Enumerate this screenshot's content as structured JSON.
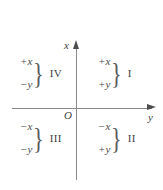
{
  "figure": {
    "background_color": "#ffffff",
    "axis_color": "#8a8a8a",
    "text_color": "#4a4a4a"
  },
  "axes": {
    "vertical_label": "x",
    "horizontal_label": "y",
    "origin_label": "O"
  },
  "brace_glyph": "}",
  "quadrants": [
    {
      "position": "upper-left",
      "numeral": "IV",
      "sign_x": "+x",
      "sign_y": "−y"
    },
    {
      "position": "upper-right",
      "numeral": "I",
      "sign_x": "+x",
      "sign_y": "+y"
    },
    {
      "position": "lower-left",
      "numeral": "III",
      "sign_x": "−x",
      "sign_y": "−y"
    },
    {
      "position": "lower-right",
      "numeral": "II",
      "sign_x": "−x",
      "sign_y": "+y"
    }
  ]
}
